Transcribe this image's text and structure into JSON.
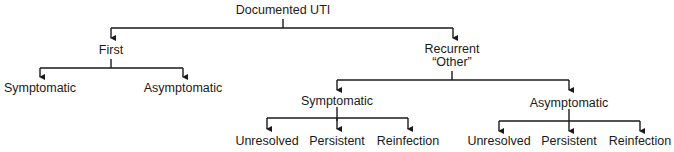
{
  "diagram": {
    "type": "tree",
    "line_color": "#1a1a1a",
    "root": {
      "label": "Documented UTI"
    },
    "level1": [
      {
        "label": "First"
      },
      {
        "label_line1": "Recurrent",
        "label_line2": "“Other”"
      }
    ],
    "first_children": [
      {
        "label": "Symptomatic"
      },
      {
        "label": "Asymptomatic"
      }
    ],
    "recurrent_children": [
      {
        "label": "Symptomatic"
      },
      {
        "label": "Asymptomatic"
      }
    ],
    "recurrent_symptomatic_children": [
      {
        "label": "Unresolved"
      },
      {
        "label": "Persistent"
      },
      {
        "label": "Reinfection"
      }
    ],
    "recurrent_asymptomatic_children": [
      {
        "label": "Unresolved"
      },
      {
        "label": "Persistent"
      },
      {
        "label": "Reinfection"
      }
    ]
  }
}
